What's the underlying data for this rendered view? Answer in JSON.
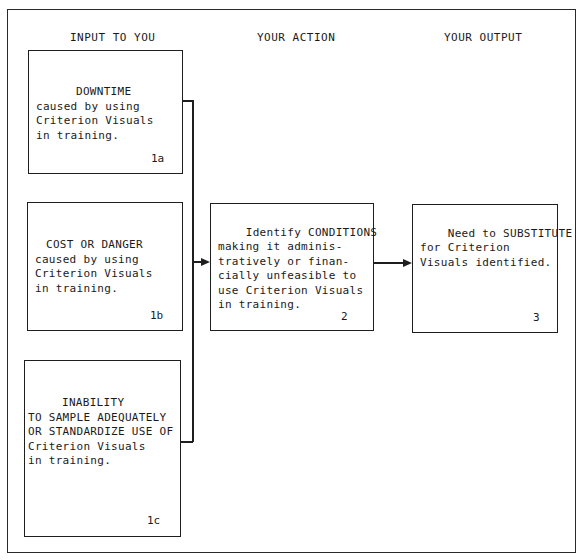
{
  "columns": {
    "input": "INPUT TO YOU",
    "action": "YOUR ACTION",
    "output": "YOUR OUTPUT"
  },
  "boxes": {
    "b1a": {
      "title": "DOWNTIME",
      "body": "caused by using\nCriterion Visuals\nin training.",
      "number": "1a"
    },
    "b1b": {
      "title": "COST OR DANGER",
      "body": "caused by using\nCriterion Visuals\nin training.",
      "number": "1b"
    },
    "b1c": {
      "title": "INABILITY",
      "body": "TO SAMPLE ADEQUATELY\nOR STANDARDIZE USE OF\nCriterion Visuals\nin training.",
      "number": "1c"
    },
    "b2": {
      "body": "Identify CONDITIONS\nmaking it adminis-\ntratively or finan-\ncially unfeasible to\nuse Criterion Visuals\nin training.",
      "number": "2"
    },
    "b3": {
      "body": "Need to SUBSTITUTE\nfor Criterion\nVisuals identified.",
      "number": "3"
    }
  },
  "colors": {
    "line": "#1e1e1e",
    "background": "#ffffff"
  }
}
